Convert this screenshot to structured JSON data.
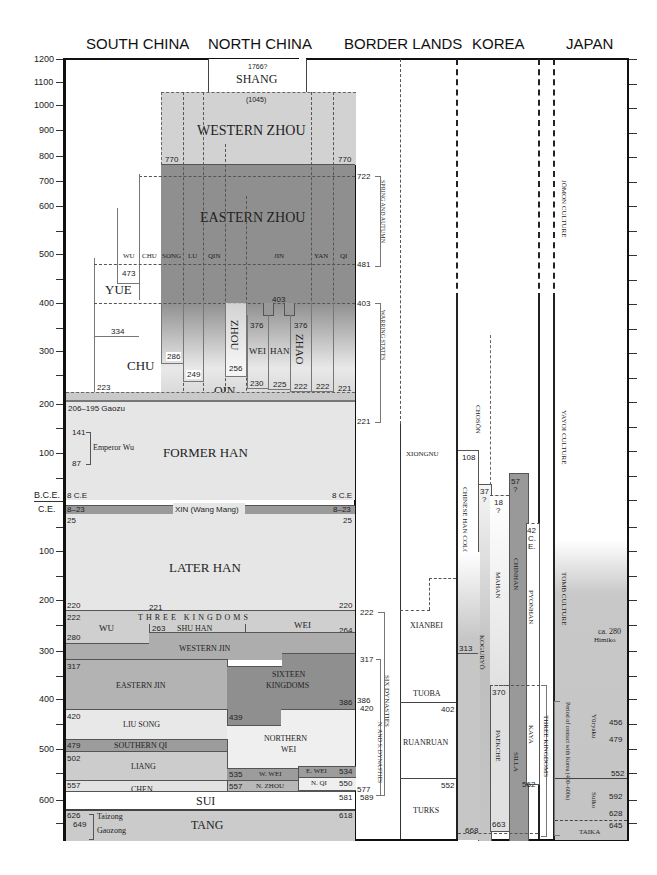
{
  "headers": [
    "SOUTH CHINA",
    "NORTH CHINA",
    "BORDER LANDS",
    "KOREA",
    "JAPAN"
  ],
  "axis": {
    "bce_ticks": [
      "1200",
      "1100",
      "1000",
      "900",
      "800",
      "700",
      "600",
      "500",
      "400",
      "300",
      "200",
      "100"
    ],
    "era_bce": "B.C.E.",
    "era_ce": "C.E.",
    "ce_ticks": [
      "100",
      "200",
      "300",
      "400",
      "500",
      "600"
    ]
  },
  "north_china": {
    "shang": {
      "label": "SHANG",
      "start": "1766?",
      "end": "(1045)"
    },
    "western_zhou": {
      "label": "WESTERN ZHOU",
      "end_left": "770",
      "end_right": "770"
    },
    "eastern_zhou": {
      "label": "EASTERN ZHOU"
    },
    "states": [
      "WU",
      "CHU",
      "SONG",
      "LU",
      "QIN",
      "JIN",
      "YAN",
      "QI"
    ],
    "warring": [
      "ZHOU",
      "WEI",
      "HAN",
      "ZHAO",
      "QIN"
    ],
    "dates": {
      "d403": "403",
      "d376a": "376",
      "d376b": "376",
      "d286": "286",
      "d249": "249",
      "d256": "256",
      "d230": "230",
      "d225": "225",
      "d222a": "222",
      "d222b": "222",
      "d221": "221"
    }
  },
  "south_china": {
    "yue": "YUE",
    "chu": "CHU",
    "d473": "473",
    "d334": "334",
    "d223": "223"
  },
  "han": {
    "gaozu": "206–195 Gaozu",
    "wu_start": "141",
    "wu_end": "87",
    "emperor_wu": "Emperor Wu",
    "former_han": "FORMER HAN",
    "bce8_left": "8 C.E",
    "bce8_right": "8 C.E",
    "xin": "XIN (Wang Mang)",
    "xin_left": "8–23",
    "xin_right": "8–23",
    "d25_left": "25",
    "d25_right": "25",
    "later_han": "LATER HAN",
    "d220_left": "220",
    "d220_right": "220",
    "d221": "221"
  },
  "three_kingdoms": {
    "title": "THREE KINGDOMS",
    "wu": "WU",
    "shu_han": "SHU HAN",
    "wei": "WEI",
    "d222": "222",
    "d263": "263",
    "d264": "264",
    "d280": "280",
    "d265": "265"
  },
  "later": {
    "western_jin": "WESTERN JIN",
    "d304": "304",
    "eastern_jin": "EASTERN JIN",
    "d317": "317",
    "sixteen_kingdoms": [
      "SIXTEEN",
      "KINGDOMS"
    ],
    "d386": "386",
    "d439": "439",
    "liu_song": "LIU SONG",
    "d420": "420",
    "southern_qi": "SOUTHERN QI",
    "d479": "479",
    "liang": "LIANG",
    "d502": "502",
    "northern_wei": [
      "NORTHERN",
      "WEI"
    ],
    "w_wei": "W. WEI",
    "d535": "535",
    "e_wei": "E. WEI",
    "d534": "534",
    "n_zhou": "N. ZHOU",
    "d557b": "557",
    "n_qi": "N. QI",
    "d550": "550",
    "chen": "CHEN",
    "d557": "557",
    "d589": "589",
    "sui": "SUI",
    "d581": "581",
    "tang": "TANG",
    "d618": "618",
    "d626": "626",
    "d649": "649",
    "taizong": "Taizong",
    "gaozong": "Gaozong"
  },
  "periods": {
    "spring_autumn": "SPRING AND AUTUMN",
    "sa_start": "722",
    "sa_end": "481",
    "warring_states": "WARRING STATES",
    "ws_start": "403",
    "ws_end": "221",
    "six_dynasties": "SIX DYNASTIES",
    "sd_start": "222",
    "sd_end": "589",
    "ns_dynasties": "N. AND S. DYNASTIES",
    "ns_start": "317",
    "ns_386": "386",
    "ns_420": "420",
    "ns_577": "577",
    "ns_589": "589"
  },
  "border_lands": {
    "xiongnu": "XIONGNU",
    "xianbei": "XIANBEI",
    "tuoba": "TUOBA",
    "ruanruan": "RUANRUAN",
    "d402": "402",
    "turks": "TURKS",
    "d552": "552"
  },
  "korea": {
    "choson": "CHOSŎN",
    "chinese_han_colonies": "CHINESE HAN COLONIES",
    "d108": "108",
    "d313": "313",
    "koguryo": "KOGURYŎ",
    "d37": "37",
    "q37": "?",
    "d668": "668",
    "mahan": "MAHAN",
    "d18": "18",
    "q18": "?",
    "paekche": "PAEKCHE",
    "d370": "370",
    "d663": "663",
    "chinhan": "CHINHAN",
    "d57": "57",
    "q57": "?",
    "silla": "SILLA",
    "pyonhan": "PYONHAN",
    "d42": "42",
    "ce": "C.",
    "ce2": "E.",
    "kaya": "KAYA",
    "d562": "562",
    "three_kingdoms": "THREE KINGDOMS"
  },
  "japan": {
    "jomon": "JŌMON CULTURE",
    "yayoi": "YAYOI CULTURE",
    "tomb": "TOMB CULTURE",
    "himiko_date": "ca. 280",
    "himiko": "Himiko",
    "contact": "Period of contact with Korea (400–600s)",
    "yuryaku": "Yūryaku",
    "d456": "456",
    "d479": "479",
    "d552": "552",
    "suiko": "Suiko",
    "d592": "592",
    "d628": "628",
    "d645": "645",
    "taika": "TAIKA"
  }
}
